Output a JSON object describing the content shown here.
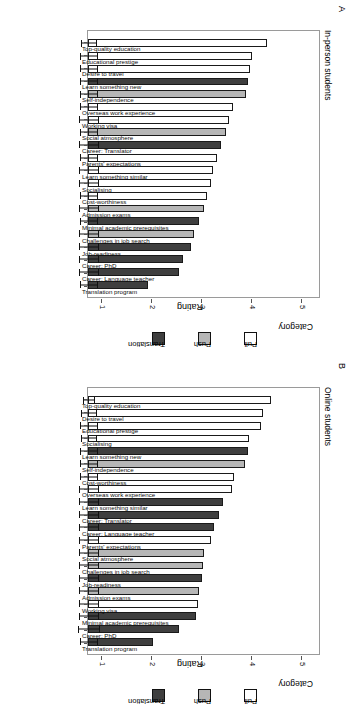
{
  "figure": {
    "panels": [
      {
        "letter": "A",
        "title": "In-person students",
        "axis": {
          "title": "Rating",
          "ticks": [
            1,
            2,
            3,
            4,
            5
          ],
          "min": 0.72,
          "max": 5.35
        }
      },
      {
        "letter": "B",
        "title": "Online students",
        "axis": {
          "title": "Rating",
          "ticks": [
            1,
            2,
            3,
            4,
            5
          ],
          "min": 0.72,
          "max": 5.35
        }
      }
    ],
    "legend": {
      "title": "Category",
      "items": [
        {
          "label": "Pull",
          "key": "pull",
          "color": "#ffffff"
        },
        {
          "label": "Push",
          "key": "push",
          "color": "#b6b6b6"
        },
        {
          "label": "Translation",
          "key": "translation",
          "color": "#3f3f3f"
        }
      ]
    }
  },
  "chart_data": [
    {
      "type": "bar",
      "title": "In-person students",
      "panel": "A",
      "xlabel": "",
      "ylabel": "Rating",
      "ylim": [
        0.72,
        5.35
      ],
      "yticks": [
        1,
        2,
        3,
        4,
        5
      ],
      "grid": false,
      "legend_position": "right",
      "categories": [
        "Top-quality education",
        "Educational prestige",
        "Desire to travel",
        "Learn something new",
        "Self-independence",
        "Overseas work experience",
        "Working visa",
        "Social atmosphere",
        "Career: Translator",
        "Parents' expectations",
        "Learn something similar",
        "Socialising",
        "Cost-worthiness",
        "Admission exams",
        "Minimal academic prerequisites",
        "Challenges in job search",
        "Job-readiness",
        "Career: PhD",
        "Career: Language teacher",
        "Translation program"
      ],
      "groups": [
        "pull",
        "pull",
        "pull",
        "translation",
        "push",
        "pull",
        "pull",
        "push",
        "translation",
        "pull",
        "pull",
        "pull",
        "pull",
        "push",
        "translation",
        "push",
        "translation",
        "translation",
        "translation",
        "translation"
      ],
      "values": [
        4.3,
        4.0,
        3.96,
        3.92,
        3.88,
        3.62,
        3.55,
        3.48,
        3.38,
        3.3,
        3.22,
        3.18,
        3.1,
        3.05,
        2.95,
        2.85,
        2.78,
        2.62,
        2.55,
        1.92
      ],
      "errors": [
        0.17,
        0.18,
        0.18,
        0.18,
        0.19,
        0.18,
        0.2,
        0.19,
        0.2,
        0.18,
        0.2,
        0.2,
        0.19,
        0.2,
        0.19,
        0.2,
        0.2,
        0.2,
        0.2,
        0.18
      ]
    },
    {
      "type": "bar",
      "title": "Online students",
      "panel": "B",
      "xlabel": "",
      "ylabel": "Rating",
      "ylim": [
        0.72,
        5.35
      ],
      "yticks": [
        1,
        2,
        3,
        4,
        5
      ],
      "grid": false,
      "legend_position": "right",
      "categories": [
        "Top-quality education",
        "Desire to travel",
        "Educational prestige",
        "Socialising",
        "Learn something new",
        "Self-independence",
        "Cost-worthiness",
        "Overseas work experience",
        "Learn something similar",
        "Career: Translator",
        "Career: Language teacher",
        "Parents' expectations",
        "Social atmosphere",
        "Challenges in job search",
        "Job-readiness",
        "Admission exams",
        "Working visa",
        "Minimal academic prerequisites",
        "Career: PhD",
        "Translation program"
      ],
      "groups": [
        "pull",
        "pull",
        "pull",
        "pull",
        "translation",
        "push",
        "pull",
        "pull",
        "translation",
        "translation",
        "translation",
        "pull",
        "push",
        "push",
        "translation",
        "push",
        "pull",
        "translation",
        "translation",
        "translation"
      ],
      "values": [
        4.38,
        4.22,
        4.18,
        3.95,
        3.92,
        3.86,
        3.64,
        3.6,
        3.42,
        3.34,
        3.25,
        3.18,
        3.05,
        3.02,
        3.0,
        2.95,
        2.92,
        2.88,
        2.55,
        2.02
      ],
      "errors": [
        0.13,
        0.17,
        0.18,
        0.17,
        0.18,
        0.19,
        0.18,
        0.2,
        0.2,
        0.2,
        0.2,
        0.2,
        0.2,
        0.2,
        0.21,
        0.21,
        0.2,
        0.21,
        0.22,
        0.19
      ]
    }
  ]
}
